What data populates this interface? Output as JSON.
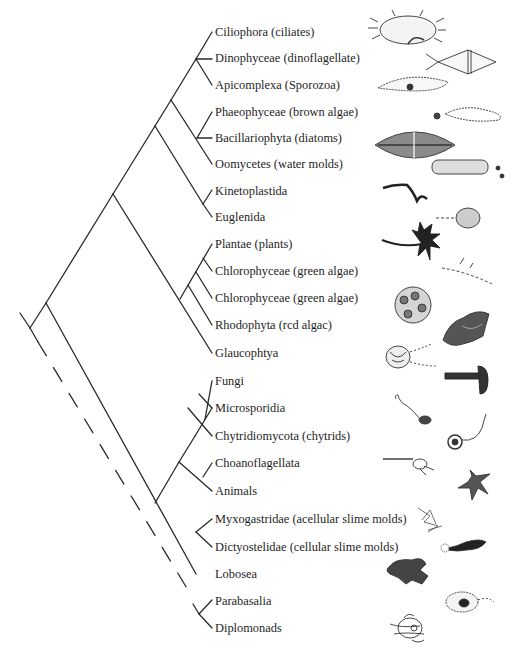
{
  "diagram": {
    "type": "phylogenetic-tree",
    "line_color": "#2a2a2a",
    "text_color": "#1e1e1e",
    "taxa": [
      {
        "label": "Ciliophora (ciliates)",
        "y": 32,
        "illustration": "ciliate"
      },
      {
        "label": "Dinophyceae (dinoflagellate)",
        "y": 58,
        "illustration": "dinoflagellate"
      },
      {
        "label": "Apicomplexa (Sporozoa)",
        "y": 85,
        "illustration": "sporozoan"
      },
      {
        "label": "Phaeophyceae (brown algae)",
        "y": 112,
        "illustration": "brown-alga-zoospore"
      },
      {
        "label": "Bacillariophyta (diatoms)",
        "y": 138,
        "illustration": "diatom"
      },
      {
        "label": "Oomycetes (water molds)",
        "y": 164,
        "illustration": "water-mold"
      },
      {
        "label": "Kinetoplastida",
        "y": 191,
        "illustration": "trypanosome"
      },
      {
        "label": "Euglenida",
        "y": 217,
        "illustration": "euglena"
      },
      {
        "label": "Plantae (plants)",
        "y": 244,
        "illustration": "palm-tree"
      },
      {
        "label": "Chlorophyceae (green algae)",
        "y": 271,
        "illustration": "green-alga-filament"
      },
      {
        "label": "Chlorophyceae (green algae)",
        "y": 298,
        "illustration": "volvox"
      },
      {
        "label": "Rhodophyta (rcd algac)",
        "y": 325,
        "illustration": "red-alga"
      },
      {
        "label": "Glaucophtya",
        "y": 353,
        "illustration": "glaucophyte"
      },
      {
        "label": "Fungi",
        "y": 381,
        "illustration": "mushroom"
      },
      {
        "label": "Microsporidia",
        "y": 408,
        "illustration": "microsporidian"
      },
      {
        "label": "Chytridiomycota (chytrids)",
        "y": 436,
        "illustration": "chytrid"
      },
      {
        "label": "Choanoflagellata",
        "y": 463,
        "illustration": "choanoflagellate"
      },
      {
        "label": "Animals",
        "y": 491,
        "illustration": "starfish"
      },
      {
        "label": "Myxogastridae (acellular slime molds)",
        "y": 519,
        "illustration": "plasmodial-slime-mold"
      },
      {
        "label": "Dictyostelidae (cellular slime molds)",
        "y": 547,
        "illustration": "dictyostelium"
      },
      {
        "label": "Lobosea",
        "y": 574,
        "illustration": "amoeba"
      },
      {
        "label": "Parabasalia",
        "y": 601,
        "illustration": "trichomonad"
      },
      {
        "label": "Diplomonads",
        "y": 628,
        "illustration": "giardia"
      }
    ]
  }
}
